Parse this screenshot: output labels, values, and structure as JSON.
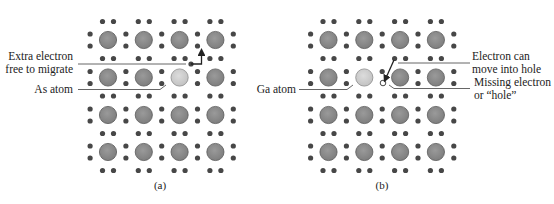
{
  "figure": {
    "panels": [
      {
        "id": "a",
        "caption": "(a)",
        "dopant_label": "As atom",
        "callout_label_line1": "Extra electron",
        "callout_label_line2": "free to migrate",
        "dopant_position": {
          "row": 1,
          "col": 2
        },
        "feature": "extra-electron"
      },
      {
        "id": "b",
        "caption": "(b)",
        "dopant_label": "Ga atom",
        "callout_label_line1": "Electron can",
        "callout_label_line2": "move into hole",
        "callout2_label_line1": "Missing electron",
        "callout2_label_line2": "or “hole”",
        "dopant_position": {
          "row": 1,
          "col": 1
        },
        "feature": "hole"
      }
    ],
    "lattice": {
      "rows": 4,
      "cols": 4
    },
    "colors": {
      "atom_fill": "#8c8c8c",
      "atom_stroke": "#5a5a5a",
      "dopant_fill": "#cfcfcf",
      "electron": "#474747",
      "line": "#555555",
      "text": "#222222"
    }
  }
}
